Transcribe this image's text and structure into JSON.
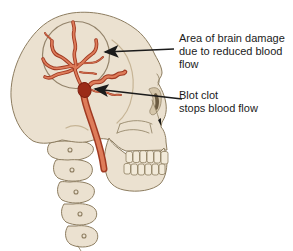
{
  "labels": {
    "brain_damage": {
      "lines": [
        "Area of brain damage",
        "due to reduced blood",
        "flow"
      ]
    },
    "blood_clot": {
      "lines": [
        "Blot clot",
        "stops blood flow"
      ]
    }
  },
  "colors": {
    "background": "#ffffff",
    "bone-fill": "#ebe1d0",
    "bone-shadow": "#d5c6aa",
    "bone-outline": "#8d7d60",
    "artery-fill": "#de7c5a",
    "artery-outline": "#a03a22",
    "clot": "#9b2b18",
    "annotation": "#1b1b1b"
  }
}
